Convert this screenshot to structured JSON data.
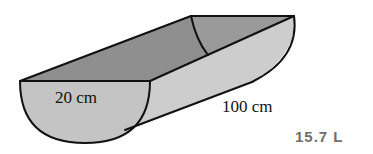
{
  "diagram": {
    "shape": "half-cylinder trough",
    "labels": {
      "diameter": "20 cm",
      "length": "100 cm"
    },
    "colors": {
      "outline": "#111111",
      "inner_face": "#8f8f8f",
      "end_face": "#c4c4c4",
      "side_face": "#cdcdcd",
      "back_inner": "#9a9a9a"
    }
  },
  "answer": {
    "value": "15.7 L",
    "color": "#6e6e6e"
  }
}
